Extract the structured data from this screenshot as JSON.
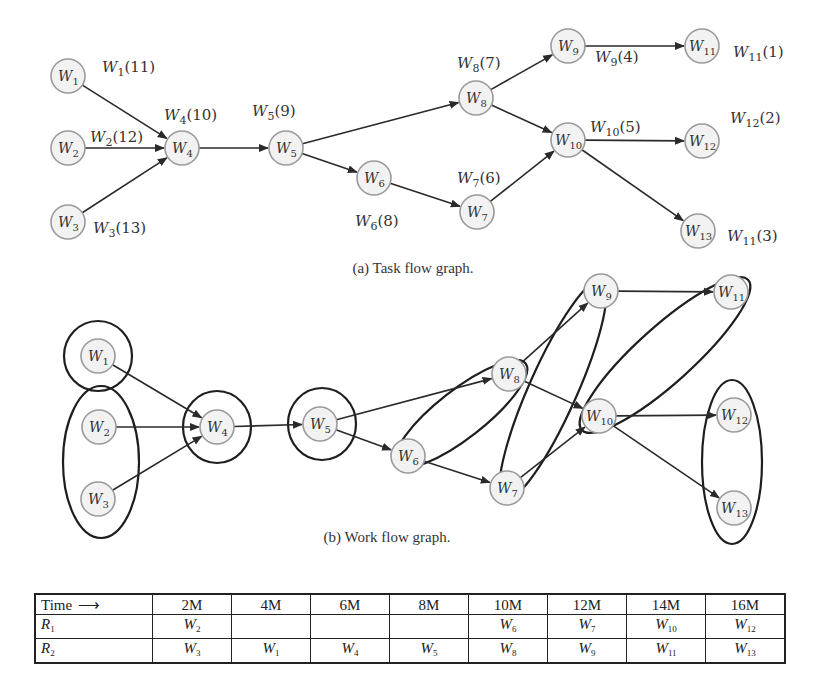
{
  "task_flow_graph": {
    "caption": "(a) Task flow graph.",
    "nodes": [
      {
        "id": "W1",
        "sub": "1",
        "x": 68,
        "y": 76,
        "label": "W1(11)",
        "lsub": "1",
        "lval": "(11)",
        "lx": 102,
        "ly": 72
      },
      {
        "id": "W2",
        "sub": "2",
        "x": 68,
        "y": 148,
        "label": "W2(12)",
        "lsub": "2",
        "lval": "(12)",
        "lx": 90,
        "ly": 142
      },
      {
        "id": "W3",
        "sub": "3",
        "x": 68,
        "y": 222,
        "label": "W3(13)",
        "lsub": "3",
        "lval": "(13)",
        "lx": 93,
        "ly": 233
      },
      {
        "id": "W4",
        "sub": "4",
        "x": 182,
        "y": 148,
        "label": "W4(10)",
        "lsub": "4",
        "lval": "(10)",
        "lx": 164,
        "ly": 120
      },
      {
        "id": "W5",
        "sub": "5",
        "x": 286,
        "y": 148,
        "label": "W5(9)",
        "lsub": "5",
        "lval": "(9)",
        "lx": 252,
        "ly": 116
      },
      {
        "id": "W6",
        "sub": "6",
        "x": 374,
        "y": 178,
        "label": "W6(8)",
        "lsub": "6",
        "lval": "(8)",
        "lx": 355,
        "ly": 226
      },
      {
        "id": "W7",
        "sub": "7",
        "x": 477,
        "y": 212,
        "label": "W7(6)",
        "lsub": "7",
        "lval": "(6)",
        "lx": 457,
        "ly": 183
      },
      {
        "id": "W8",
        "sub": "8",
        "x": 476,
        "y": 98,
        "label": "W8(7)",
        "lsub": "8",
        "lval": "(7)",
        "lx": 457,
        "ly": 68
      },
      {
        "id": "W9",
        "sub": "9",
        "x": 568,
        "y": 46,
        "label": "W9(4)",
        "lsub": "9",
        "lval": "(4)",
        "lx": 595,
        "ly": 62
      },
      {
        "id": "W10",
        "sub": "10",
        "x": 568,
        "y": 140,
        "label": "W10(5)",
        "lsub": "10",
        "lval": "(5)",
        "lx": 590,
        "ly": 132
      },
      {
        "id": "W11",
        "sub": "11",
        "x": 702,
        "y": 46,
        "label": "W11(1)",
        "lsub": "11",
        "lval": "(1)",
        "lx": 733,
        "ly": 57
      },
      {
        "id": "W12",
        "sub": "12",
        "x": 702,
        "y": 141,
        "label": "W12(2)",
        "lsub": "12",
        "lval": "(2)",
        "lx": 730,
        "ly": 123
      },
      {
        "id": "W13",
        "sub": "13",
        "x": 698,
        "y": 231,
        "label": "W11(3)",
        "lsub": "11",
        "lval": "(3)",
        "lx": 727,
        "ly": 241
      }
    ],
    "edges": [
      [
        "W1",
        "W4"
      ],
      [
        "W2",
        "W4"
      ],
      [
        "W3",
        "W4"
      ],
      [
        "W4",
        "W5"
      ],
      [
        "W5",
        "W8"
      ],
      [
        "W5",
        "W6"
      ],
      [
        "W6",
        "W7"
      ],
      [
        "W8",
        "W9"
      ],
      [
        "W8",
        "W10"
      ],
      [
        "W7",
        "W10"
      ],
      [
        "W9",
        "W11"
      ],
      [
        "W10",
        "W12"
      ],
      [
        "W10",
        "W13"
      ]
    ]
  },
  "work_flow_graph": {
    "caption": "(b) Work flow graph.",
    "nodes": [
      {
        "id": "W1",
        "sub": "1",
        "x": 98,
        "y": 356
      },
      {
        "id": "W2",
        "sub": "2",
        "x": 99,
        "y": 427
      },
      {
        "id": "W3",
        "sub": "3",
        "x": 98,
        "y": 499
      },
      {
        "id": "W4",
        "sub": "4",
        "x": 217,
        "y": 427
      },
      {
        "id": "W5",
        "sub": "5",
        "x": 320,
        "y": 424
      },
      {
        "id": "W6",
        "sub": "6",
        "x": 408,
        "y": 456
      },
      {
        "id": "W7",
        "sub": "7",
        "x": 507,
        "y": 488
      },
      {
        "id": "W8",
        "sub": "8",
        "x": 509,
        "y": 374
      },
      {
        "id": "W9",
        "sub": "9",
        "x": 601,
        "y": 291
      },
      {
        "id": "W10",
        "sub": "10",
        "x": 599,
        "y": 416
      },
      {
        "id": "W11",
        "sub": "11",
        "x": 731,
        "y": 292
      },
      {
        "id": "W12",
        "sub": "12",
        "x": 734,
        "y": 415
      },
      {
        "id": "W13",
        "sub": "13",
        "x": 734,
        "y": 508
      }
    ],
    "edges": [
      [
        "W1",
        "W4"
      ],
      [
        "W2",
        "W4"
      ],
      [
        "W3",
        "W4"
      ],
      [
        "W4",
        "W5"
      ],
      [
        "W5",
        "W8"
      ],
      [
        "W5",
        "W6"
      ],
      [
        "W6",
        "W7"
      ],
      [
        "W8",
        "W9"
      ],
      [
        "W8",
        "W10"
      ],
      [
        "W7",
        "W10"
      ],
      [
        "W9",
        "W11"
      ],
      [
        "W10",
        "W12"
      ],
      [
        "W10",
        "W13"
      ]
    ],
    "groups": [
      {
        "name": "group-w1",
        "type": "circle",
        "cx": 98,
        "cy": 356,
        "rx": 34,
        "ry": 35,
        "rot": 0
      },
      {
        "name": "group-w2-w3",
        "type": "ellipse",
        "cx": 101,
        "cy": 462,
        "rx": 38,
        "ry": 76,
        "rot": 0
      },
      {
        "name": "group-w4",
        "type": "circle",
        "cx": 217,
        "cy": 427,
        "rx": 34,
        "ry": 36,
        "rot": 0
      },
      {
        "name": "group-w5",
        "type": "circle",
        "cx": 322,
        "cy": 424,
        "rx": 34,
        "ry": 36,
        "rot": 0
      },
      {
        "name": "group-w6-w8",
        "type": "ellipse",
        "cx": 461,
        "cy": 414,
        "rx": 82,
        "ry": 24,
        "rot": -38
      },
      {
        "name": "group-w7-w9",
        "type": "ellipse",
        "cx": 553,
        "cy": 390,
        "rx": 120,
        "ry": 24,
        "rot": -66
      },
      {
        "name": "group-w10-w11",
        "type": "ellipse",
        "cx": 665,
        "cy": 355,
        "rx": 112,
        "ry": 28,
        "rot": -42
      },
      {
        "name": "group-w12-w13",
        "type": "ellipse",
        "cx": 732,
        "cy": 462,
        "rx": 30,
        "ry": 82,
        "rot": 0
      }
    ]
  },
  "schedule_table": {
    "header_label": "Time",
    "header_arrow": "⟶",
    "columns": [
      "2M",
      "4M",
      "6M",
      "8M",
      "10M",
      "12M",
      "14M",
      "16M"
    ],
    "rows": [
      {
        "resource": "R",
        "rsub": "1",
        "cells": [
          {
            "w": "W",
            "sub": "2"
          },
          {
            "w": "",
            "sub": ""
          },
          {
            "w": "",
            "sub": ""
          },
          {
            "w": "",
            "sub": ""
          },
          {
            "w": "W",
            "sub": "6"
          },
          {
            "w": "W",
            "sub": "7"
          },
          {
            "w": "W",
            "sub": "10"
          },
          {
            "w": "W",
            "sub": "12"
          }
        ]
      },
      {
        "resource": "R",
        "rsub": "2",
        "cells": [
          {
            "w": "W",
            "sub": "3"
          },
          {
            "w": "W",
            "sub": "1"
          },
          {
            "w": "W",
            "sub": "4"
          },
          {
            "w": "W",
            "sub": "5"
          },
          {
            "w": "W",
            "sub": "8"
          },
          {
            "w": "W",
            "sub": "9"
          },
          {
            "w": "W",
            "sub": "11"
          },
          {
            "w": "W",
            "sub": "13"
          }
        ]
      }
    ]
  },
  "colors": {
    "node_fill": "#f2f2f2",
    "node_stroke": "#9a9a9a",
    "edge": "#2a2a2a",
    "group_stroke": "#1e1e1e"
  }
}
